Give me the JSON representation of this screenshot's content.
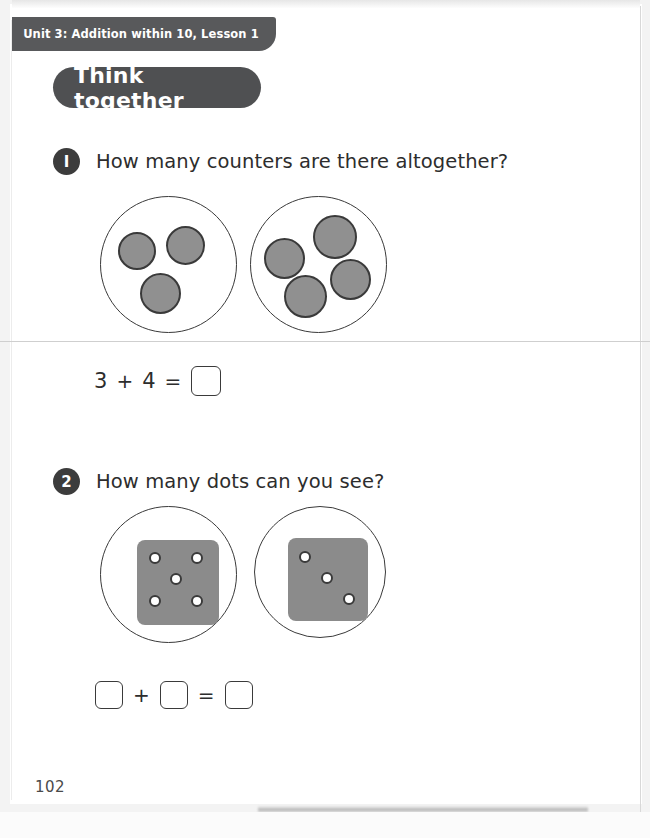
{
  "page": {
    "unit_tab_label": "Unit 3: Addition within 10, Lesson 1",
    "banner_label": "Think together",
    "page_number": "102",
    "accent_dark": "#58595b",
    "banner_dark": "#4f5052",
    "counter_fill": "#909090",
    "die_fill": "#8b8b8b",
    "outline": "#3a3a3a"
  },
  "questions": [
    {
      "number": "1",
      "badge_glyph": "I",
      "text": "How many counters are there altogether?",
      "visual_type": "counter-groups",
      "groups": [
        {
          "count": 3,
          "counters": [
            {
              "left": 17,
              "top": 35,
              "size": 38
            },
            {
              "left": 65,
              "top": 29,
              "size": 39
            },
            {
              "left": 39,
              "top": 76,
              "size": 41
            }
          ]
        },
        {
          "count": 4,
          "counters": [
            {
              "left": 13,
              "top": 41,
              "size": 41
            },
            {
              "left": 62,
              "top": 18,
              "size": 44
            },
            {
              "left": 79,
              "top": 62,
              "size": 41
            },
            {
              "left": 33,
              "top": 78,
              "size": 43
            }
          ]
        }
      ],
      "equation": {
        "left_addend": "3",
        "plus": "+",
        "right_addend": "4",
        "equals": "=",
        "answer": ""
      }
    },
    {
      "number": "2",
      "badge_glyph": "2",
      "text": "How many dots can you see?",
      "visual_type": "dice",
      "dice": [
        {
          "pips": 5,
          "dots": [
            {
              "left": 12,
              "top": 12
            },
            {
              "left": 54,
              "top": 12
            },
            {
              "left": 33,
              "top": 33
            },
            {
              "left": 12,
              "top": 55
            },
            {
              "left": 54,
              "top": 55
            }
          ]
        },
        {
          "pips": 3,
          "dots": [
            {
              "left": 11,
              "top": 13
            },
            {
              "left": 33,
              "top": 34
            },
            {
              "left": 55,
              "top": 55
            }
          ]
        }
      ],
      "equation": {
        "left_addend": "",
        "plus": "+",
        "right_addend": "",
        "equals": "=",
        "answer": ""
      }
    }
  ]
}
